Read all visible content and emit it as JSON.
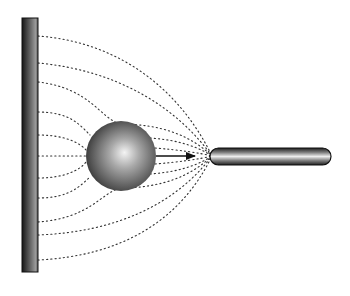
{
  "diagram": {
    "canvas": {
      "width": 350,
      "height": 296,
      "background": "#ffffff"
    },
    "wall": {
      "x": 22,
      "y": 18,
      "width": 16,
      "height": 254,
      "dark": "#1a1a1a",
      "light": "#8a8a8a"
    },
    "sphere": {
      "cx": 121,
      "cy": 156,
      "r": 35,
      "highlight": "#f2f2f2",
      "shade": "#3a3a3a"
    },
    "rod": {
      "x": 210,
      "y": 148,
      "width": 121,
      "height": 17,
      "rx": 8.5
    },
    "convergence_point": {
      "x": 212,
      "y": 156
    },
    "arrow": {
      "x1": 156,
      "y1": 156,
      "x2": 196,
      "y2": 156,
      "color": "#111111"
    },
    "field_lines": {
      "stroke": "#333333",
      "dash": "1.2 3",
      "count": 11,
      "start_ys": [
        36,
        63,
        82,
        112,
        135,
        156,
        178,
        198,
        222,
        235,
        260
      ]
    }
  }
}
